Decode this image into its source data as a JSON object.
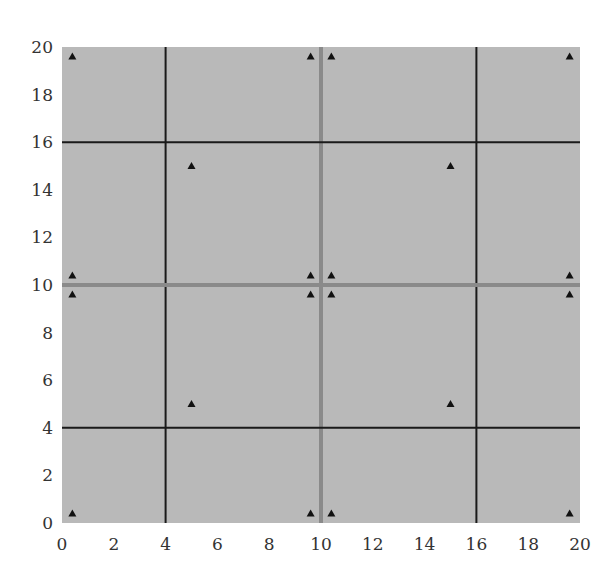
{
  "chart_data": {
    "type": "scatter",
    "title": "",
    "xlabel": "",
    "ylabel": "",
    "xlim": [
      0,
      20
    ],
    "ylim": [
      0,
      20
    ],
    "x_ticks": [
      0,
      2,
      4,
      6,
      8,
      10,
      12,
      14,
      16,
      18,
      20
    ],
    "y_ticks": [
      0,
      2,
      4,
      6,
      8,
      10,
      12,
      14,
      16,
      18,
      20
    ],
    "grid": false,
    "legend": null,
    "background_color": "#b9b9b9",
    "marker": "triangle-up",
    "marker_color": "#111111",
    "divider_lines": [
      {
        "orientation": "vertical",
        "value": 4,
        "color": "#1a1a1a",
        "width": 2
      },
      {
        "orientation": "vertical",
        "value": 10,
        "color": "#8a8a8a",
        "width": 4
      },
      {
        "orientation": "vertical",
        "value": 16,
        "color": "#1a1a1a",
        "width": 2
      },
      {
        "orientation": "horizontal",
        "value": 4,
        "color": "#1a1a1a",
        "width": 2
      },
      {
        "orientation": "horizontal",
        "value": 10,
        "color": "#8a8a8a",
        "width": 4
      },
      {
        "orientation": "horizontal",
        "value": 16,
        "color": "#1a1a1a",
        "width": 2
      }
    ],
    "series": [
      {
        "name": "points",
        "x": [
          0.4,
          9.6,
          10.4,
          19.6,
          5,
          15,
          0.4,
          9.6,
          10.4,
          19.6,
          0.4,
          9.6,
          10.4,
          19.6,
          5,
          15,
          0.4,
          9.6,
          10.4,
          19.6
        ],
        "y": [
          19.6,
          19.6,
          19.6,
          19.6,
          15,
          15,
          10.4,
          10.4,
          10.4,
          10.4,
          9.6,
          9.6,
          9.6,
          9.6,
          5,
          5,
          0.4,
          0.4,
          0.4,
          0.4
        ]
      }
    ]
  }
}
